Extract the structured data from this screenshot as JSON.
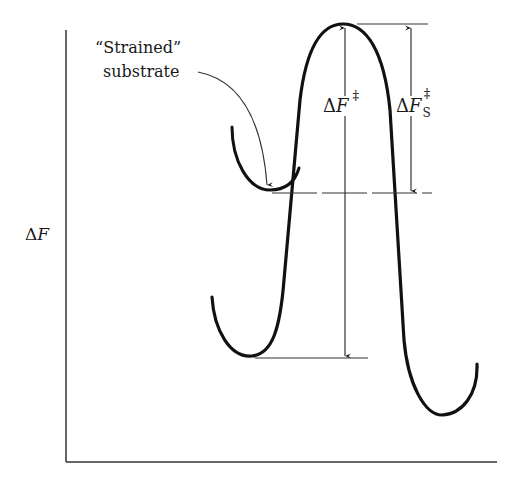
{
  "figure": {
    "type": "free-energy reaction coordinate diagram",
    "y_axis_label": {
      "delta": "Δ",
      "symbol": "F"
    },
    "annotation_strained": {
      "line1": "“Strained”",
      "line2": "substrate"
    },
    "label_barrier": {
      "delta": "Δ",
      "symbol": "F",
      "superscript": "‡"
    },
    "label_strained_barrier": {
      "delta": "Δ",
      "symbol": "F",
      "subscript": "S",
      "superscript": "‡"
    },
    "colors": {
      "ink": "#1a1a1a",
      "background": "#ffffff"
    }
  }
}
